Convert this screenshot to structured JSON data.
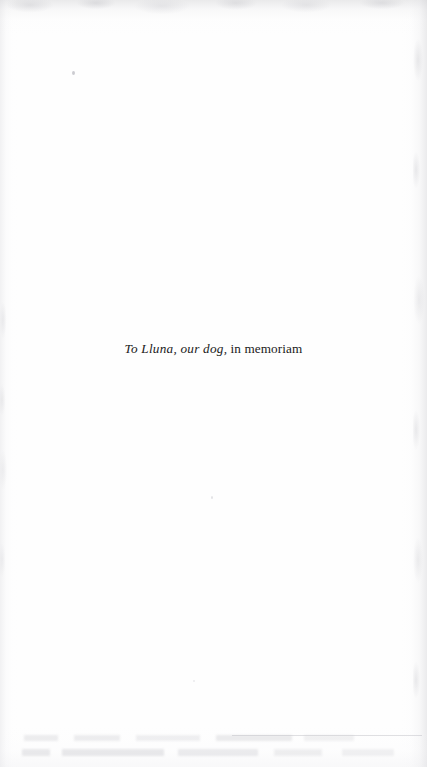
{
  "page": {
    "kind": "book-dedication-page",
    "width": 427,
    "height": 767,
    "paper_color": "#fefefe",
    "ink_color": "#1a1a1a"
  },
  "dedication": {
    "full_text": "To Lluna, our dog, in memoriam",
    "italic_part": "To Lluna, our dog,",
    "roman_part": " in memoriam"
  },
  "artifacts": {
    "scan_edge_top": "scan-edge-shadow-top",
    "scan_edge_right": "scan-edge-shadow-right",
    "scan_edge_left": "scan-edge-shadow-left",
    "scan_edge_bottom": "scan-edge-shadow-bottom",
    "showthrough_line_1": "page-showthrough-ghost-text",
    "showthrough_line_2": "page-showthrough-ghost-text",
    "showthrough_rule": "page-showthrough-rule",
    "specks": [
      "dust-speck",
      "dust-speck",
      "dust-speck"
    ]
  }
}
